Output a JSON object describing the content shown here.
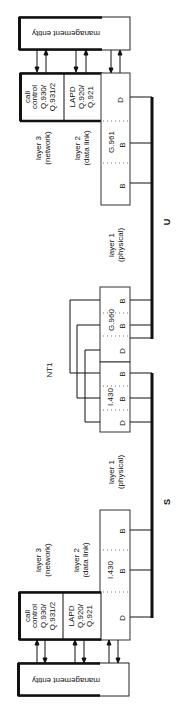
{
  "diagram": {
    "top_stack": {
      "management": "management entity",
      "l3_line1": "call",
      "l3_line2": "control",
      "l3_line3": "Q.930/",
      "l3_line4": "Q.931/2",
      "l2_line1": "LAPD",
      "l2_line2": "Q.920/",
      "l2_line3": "Q.921",
      "phys_standard": "G.961",
      "channels": [
        "D",
        "B",
        "B"
      ]
    },
    "bottom_stack": {
      "management": "management entity",
      "l3_line1": "call",
      "l3_line2": "control",
      "l3_line3": "Q.930/",
      "l3_line4": "Q.931/2",
      "l2_line1": "LAPD",
      "l2_line2": "Q.920/",
      "l2_line3": "Q.921",
      "phys_standard": "I.430",
      "channels": [
        "D",
        "B",
        "B"
      ]
    },
    "layer_labels": {
      "l3_a": "layer 3",
      "l3_b": "(network)",
      "l2_a": "layer 2",
      "l2_b": "(data link)",
      "l1_a": "layer 1",
      "l1_b": "(physical)"
    },
    "nt1": {
      "label": "NT1",
      "u_side_standard": "G.960",
      "u_side_channels": [
        "D",
        "B",
        "B"
      ],
      "s_side_standard": "I.430",
      "s_side_channels": [
        "D",
        "B",
        "B"
      ]
    },
    "interfaces": {
      "u": "U",
      "s": "S"
    }
  }
}
